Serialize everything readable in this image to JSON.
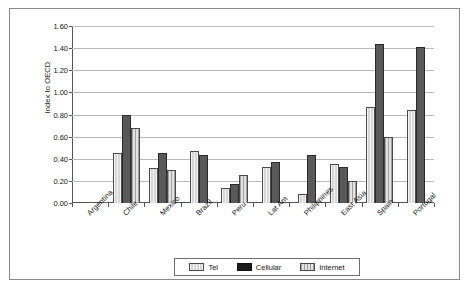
{
  "chart_data": {
    "type": "bar",
    "title": "",
    "subtitle": "",
    "xlabel": "",
    "ylabel": "Index to OECD",
    "ylim": [
      0.0,
      1.6
    ],
    "ytick_step": 0.2,
    "ytick_labels": [
      "0.00",
      "0.20",
      "0.40",
      "0.60",
      "0.80",
      "1.00",
      "1.20",
      "1.40",
      "1.60"
    ],
    "ytick_values": [
      0.0,
      0.2,
      0.4,
      0.6,
      0.8,
      1.0,
      1.2,
      1.4,
      1.6
    ],
    "grid": true,
    "legend_position": "bottom",
    "categories": [
      "Argentina",
      "Chile",
      "Mexico",
      "Brazil",
      "Peru",
      "Lat Am",
      "Philippines",
      "East Asia",
      "Spain",
      "Portugal"
    ],
    "series": [
      {
        "name": "Tel",
        "color": "#d6d6d6",
        "values": [
          0.0,
          0.45,
          0.32,
          0.47,
          0.14,
          0.33,
          0.08,
          0.35,
          0.87,
          0.84
        ]
      },
      {
        "name": "Cellular",
        "color": "#1b1b1b",
        "values": [
          0.0,
          0.8,
          0.45,
          0.43,
          0.17,
          0.37,
          0.43,
          0.33,
          1.44,
          1.41
        ]
      },
      {
        "name": "Internet",
        "color": "#e2e2e2",
        "values": [
          0.0,
          0.68,
          0.3,
          0.0,
          0.25,
          0.0,
          0.0,
          0.2,
          0.6,
          0.0
        ]
      }
    ]
  },
  "legend": {
    "items": [
      {
        "label": "Tel",
        "swatch": "tel-swatch"
      },
      {
        "label": "Cellular",
        "swatch": "cellular-swatch"
      },
      {
        "label": "Internet",
        "swatch": "internet-swatch"
      }
    ]
  }
}
